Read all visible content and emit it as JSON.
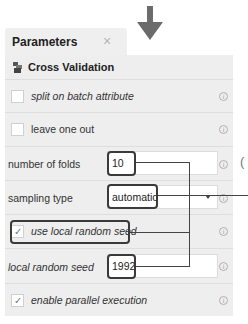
{
  "tab": {
    "title": "Parameters",
    "close_icon": "×"
  },
  "section": {
    "title": "Cross Validation",
    "icon": "cross-validation-operator-icon"
  },
  "params": [
    {
      "type": "checkbox",
      "label": "split on batch attribute",
      "checked": false,
      "italic": true
    },
    {
      "type": "checkbox",
      "label": "leave one out",
      "checked": false,
      "italic": false
    },
    {
      "type": "text",
      "label": "number of folds",
      "value": "10"
    },
    {
      "type": "select",
      "label": "sampling type",
      "value": "automatic"
    },
    {
      "type": "checkbox",
      "label": "use local random seed",
      "checked": true,
      "italic": true
    },
    {
      "type": "text",
      "label": "local random seed",
      "value": "1992",
      "italic": true
    },
    {
      "type": "checkbox",
      "label": "enable parallel execution",
      "checked": true,
      "italic": true
    }
  ],
  "glyphs": {
    "info": "i",
    "check": "✓",
    "paren": "("
  },
  "colors": {
    "panel_bg": "#eeeeee",
    "highlight": "#3a3a3a",
    "arrow": "#6b6b6b"
  }
}
